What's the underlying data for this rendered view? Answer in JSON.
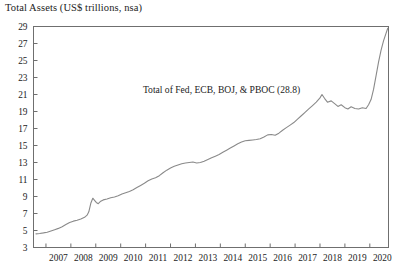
{
  "chart_data": {
    "type": "line",
    "title": "Total Assets (US$ trillions, nsa)",
    "xlabel": "",
    "ylabel": "",
    "grid": false,
    "legend_position": "none",
    "annotations": [
      {
        "text": "Total of Fed, ECB, BOJ, & PBOC (28.8)",
        "x": 2014.05,
        "y": 21.2
      }
    ],
    "xlim": [
      2006.5,
      2020.75
    ],
    "ylim": [
      3,
      29
    ],
    "ytick_labels": [
      "3",
      "5",
      "7",
      "9",
      "11",
      "13",
      "15",
      "17",
      "19",
      "21",
      "23",
      "25",
      "27",
      "29"
    ],
    "yticks": [
      3,
      5,
      7,
      9,
      11,
      13,
      15,
      17,
      19,
      21,
      23,
      25,
      27,
      29
    ],
    "xtick_labels": [
      "2007",
      "2008",
      "2009",
      "2010",
      "2011",
      "2012",
      "2013",
      "2014",
      "2015",
      "2016",
      "2017",
      "2018",
      "2019",
      "2020"
    ],
    "xticks": [
      2007,
      2008,
      2009,
      2010,
      2011,
      2012,
      2013,
      2014,
      2015,
      2016,
      2017,
      2018,
      2019,
      2020
    ],
    "series": [
      {
        "name": "Total of Fed, ECB, BOJ, & PBOC",
        "color": "#8a8a8a",
        "x": [
          2006.6,
          2006.75,
          2006.9,
          2007.05,
          2007.2,
          2007.35,
          2007.5,
          2007.65,
          2007.8,
          2007.95,
          2008.1,
          2008.25,
          2008.4,
          2008.55,
          2008.65,
          2008.72,
          2008.8,
          2008.88,
          2008.95,
          2009.02,
          2009.1,
          2009.2,
          2009.3,
          2009.45,
          2009.6,
          2009.75,
          2009.9,
          2010.05,
          2010.2,
          2010.35,
          2010.5,
          2010.65,
          2010.8,
          2010.95,
          2011.1,
          2011.25,
          2011.4,
          2011.55,
          2011.7,
          2011.85,
          2012.0,
          2012.15,
          2012.3,
          2012.45,
          2012.6,
          2012.75,
          2012.9,
          2013.05,
          2013.2,
          2013.35,
          2013.5,
          2013.65,
          2013.8,
          2013.95,
          2014.1,
          2014.25,
          2014.4,
          2014.55,
          2014.7,
          2014.85,
          2015.0,
          2015.15,
          2015.3,
          2015.45,
          2015.6,
          2015.75,
          2015.9,
          2016.05,
          2016.2,
          2016.35,
          2016.5,
          2016.65,
          2016.8,
          2016.95,
          2017.1,
          2017.25,
          2017.4,
          2017.55,
          2017.7,
          2017.85,
          2018.0,
          2018.08,
          2018.18,
          2018.3,
          2018.45,
          2018.6,
          2018.72,
          2018.85,
          2019.0,
          2019.12,
          2019.25,
          2019.4,
          2019.55,
          2019.7,
          2019.85,
          2019.95,
          2020.05,
          2020.15,
          2020.25,
          2020.35,
          2020.45,
          2020.55,
          2020.65,
          2020.72
        ],
        "y": [
          4.6,
          4.65,
          4.72,
          4.8,
          4.95,
          5.1,
          5.25,
          5.45,
          5.7,
          5.95,
          6.1,
          6.2,
          6.35,
          6.55,
          6.8,
          7.2,
          8.2,
          8.8,
          8.55,
          8.3,
          8.15,
          8.45,
          8.6,
          8.7,
          8.85,
          8.95,
          9.1,
          9.3,
          9.45,
          9.6,
          9.8,
          10.05,
          10.3,
          10.55,
          10.85,
          11.05,
          11.2,
          11.45,
          11.8,
          12.1,
          12.35,
          12.55,
          12.7,
          12.85,
          12.95,
          13.0,
          13.05,
          12.95,
          13.0,
          13.15,
          13.35,
          13.55,
          13.75,
          13.95,
          14.2,
          14.45,
          14.7,
          14.95,
          15.2,
          15.4,
          15.55,
          15.6,
          15.65,
          15.7,
          15.8,
          16.0,
          16.25,
          16.3,
          16.2,
          16.45,
          16.8,
          17.1,
          17.4,
          17.7,
          18.1,
          18.5,
          18.9,
          19.3,
          19.7,
          20.1,
          20.6,
          21.0,
          20.55,
          20.1,
          20.25,
          19.9,
          19.6,
          19.8,
          19.45,
          19.3,
          19.55,
          19.35,
          19.3,
          19.45,
          19.35,
          19.8,
          20.4,
          21.6,
          23.2,
          24.8,
          26.2,
          27.3,
          28.2,
          28.8
        ]
      }
    ]
  }
}
